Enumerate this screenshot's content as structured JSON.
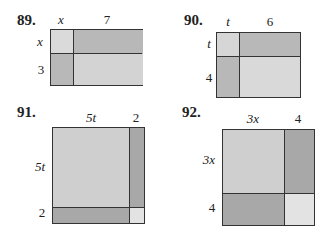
{
  "colors": {
    "light": "#d9d9d9",
    "medium": "#cdcdcd",
    "dark": "#b5b5b5",
    "border": "#333333"
  },
  "problems": [
    {
      "number": "89.",
      "top": [
        "x",
        "7"
      ],
      "left": [
        "x",
        "3"
      ]
    },
    {
      "number": "90.",
      "top": [
        "t",
        "6"
      ],
      "left": [
        "t",
        "4"
      ]
    },
    {
      "number": "91.",
      "top": [
        "5t",
        "2"
      ],
      "left": [
        "5t",
        "2"
      ]
    },
    {
      "number": "92.",
      "top": [
        "3x",
        "4"
      ],
      "left": [
        "3x",
        "4"
      ]
    }
  ]
}
